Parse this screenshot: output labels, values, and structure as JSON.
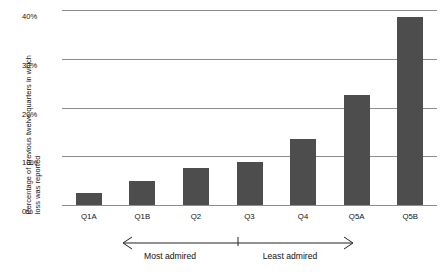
{
  "chart_data": {
    "type": "bar",
    "title": "",
    "xlabel": "",
    "ylabel": "Percentage of previous twelve quarters in which\nloss was reported",
    "categories": [
      "Q1A",
      "Q1B",
      "Q2",
      "Q3",
      "Q4",
      "Q5A",
      "Q5B"
    ],
    "values": [
      2.5,
      5.0,
      7.5,
      8.8,
      13.5,
      22.5,
      38.5
    ],
    "ylim": [
      0,
      40
    ],
    "yticks": [
      0,
      10,
      20,
      30,
      40
    ],
    "ytick_labels": [
      "0%",
      "10%",
      "20%",
      "30%",
      "40%"
    ],
    "grid": true,
    "legend": "none",
    "bar_color": "#4d4d4d",
    "gridline_color": "#8c8c8c",
    "annotations": [
      {
        "text": "Most admired",
        "span": [
          "Q1B",
          "Q3"
        ]
      },
      {
        "text": "Least admired",
        "span": [
          "Q3",
          "Q5A"
        ]
      }
    ]
  },
  "axis": {
    "y_title": "Percentage of previous twelve quarters in which\nloss was reported",
    "ticks": [
      {
        "label": "40%",
        "value": 40
      },
      {
        "label": "30%",
        "value": 30
      },
      {
        "label": "20%",
        "value": 20
      },
      {
        "label": "10%",
        "value": 10
      },
      {
        "label": "0%",
        "value": 0
      }
    ]
  },
  "bars": [
    {
      "label": "Q1A",
      "value": 2.5
    },
    {
      "label": "Q1B",
      "value": 5.0
    },
    {
      "label": "Q2",
      "value": 7.5
    },
    {
      "label": "Q3",
      "value": 8.8
    },
    {
      "label": "Q4",
      "value": 13.5
    },
    {
      "label": "Q5A",
      "value": 22.5
    },
    {
      "label": "Q5B",
      "value": 38.5
    }
  ],
  "annotation": {
    "left_label": "Most admired",
    "right_label": "Least admired"
  }
}
